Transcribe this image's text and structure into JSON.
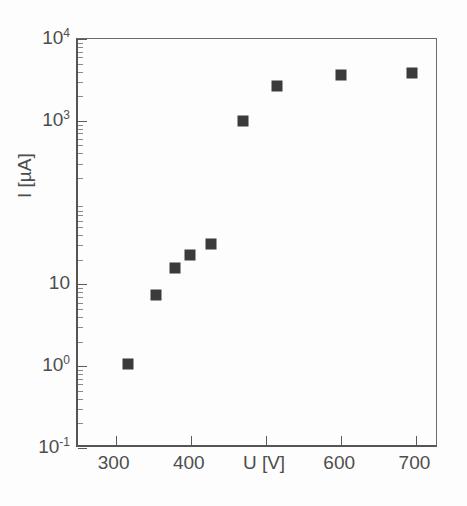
{
  "figure": {
    "background": "#fdfdfd",
    "marker_color": "#3b3b3b",
    "axis_color": "#555555"
  },
  "chart_data": {
    "type": "scatter",
    "title": "",
    "subtitle": "",
    "xlabel": "U [V]",
    "ylabel": "I [µA]",
    "x_scale": "linear",
    "y_scale": "log",
    "xlim": [
      250,
      730
    ],
    "ylim": [
      0.1,
      10000
    ],
    "grid": false,
    "legend": null,
    "annotations": [],
    "x_ticks": [
      {
        "value": 300,
        "label": "300"
      },
      {
        "value": 400,
        "label": "400"
      },
      {
        "value": 500,
        "label": "U [V]"
      },
      {
        "value": 600,
        "label": "600"
      },
      {
        "value": 700,
        "label": "700"
      }
    ],
    "y_ticks": [
      {
        "value": 10000,
        "mantissa": "10",
        "exponent": "4",
        "label": "10⁴"
      },
      {
        "value": 1000,
        "mantissa": "10",
        "exponent": "3",
        "label": "10³"
      },
      {
        "value": 10,
        "mantissa": "10",
        "exponent": "",
        "label": "10"
      },
      {
        "value": 1,
        "mantissa": "10",
        "exponent": "0",
        "label": "10⁰"
      },
      {
        "value": 0.1,
        "mantissa": "10",
        "exponent": "-1",
        "label": "10⁻¹"
      }
    ],
    "series": [
      {
        "name": "I vs U",
        "marker": "square",
        "color": "#3b3b3b",
        "x": [
          316,
          354,
          379,
          399,
          427,
          470,
          514,
          600,
          694
        ],
        "y": [
          1.05,
          7.5,
          16,
          23,
          31,
          1000,
          2700,
          3600,
          3800
        ]
      }
    ]
  }
}
